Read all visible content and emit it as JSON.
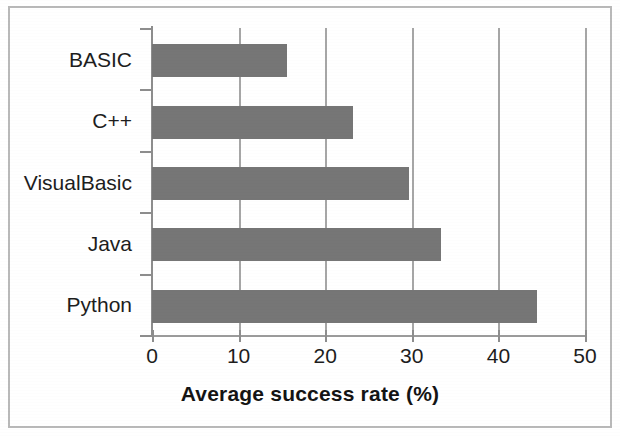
{
  "figure": {
    "border_color": "#b9b9b9",
    "background": "#ffffff"
  },
  "chart_data": {
    "type": "bar",
    "orientation": "horizontal",
    "title": "",
    "xlabel": "Average success rate (%)",
    "ylabel": "",
    "categories": [
      "BASIC",
      "C++",
      "VisualBasic",
      "Java",
      "Python"
    ],
    "values": [
      15.6,
      23.2,
      29.7,
      33.4,
      44.5
    ],
    "series": [
      {
        "name": "Average success rate (%)",
        "values": [
          15.6,
          23.2,
          29.7,
          33.4,
          44.5
        ]
      }
    ],
    "xlim": [
      0,
      50
    ],
    "xticks": [
      0,
      10,
      20,
      30,
      40,
      50
    ],
    "xtick_labels": [
      "0",
      "10",
      "20",
      "30",
      "40",
      "50"
    ],
    "grid": "vertical",
    "gridline_color": "#a6a6a6",
    "bar_color": "#767676",
    "axis_color": "#8d8d8d",
    "legend": "none",
    "legend_position": "none"
  },
  "axis": {
    "x_title": "Average success rate (%)",
    "tick_labels": [
      "0",
      "10",
      "20",
      "30",
      "40",
      "50"
    ],
    "category_labels": [
      "BASIC",
      "C++",
      "VisualBasic",
      "Java",
      "Python"
    ]
  }
}
